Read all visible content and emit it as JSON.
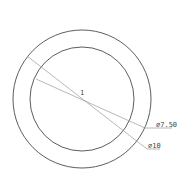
{
  "drawing": {
    "type": "circle-dimension-drawing",
    "center": {
      "x": 82,
      "y": 99
    },
    "center_mark": "1",
    "circles": [
      {
        "name": "outer",
        "radius_px": 69,
        "diameter_label": "⌀10"
      },
      {
        "name": "inner",
        "radius_px": 52,
        "diameter_label": "⌀7.50"
      }
    ],
    "dimensions": [
      {
        "label": "⌀7.50",
        "target": "inner"
      },
      {
        "label": "⌀10",
        "target": "outer"
      }
    ],
    "colors": {
      "circle": "#333333",
      "leader": "#999999",
      "text": "#444444",
      "background": "#ffffff"
    }
  }
}
